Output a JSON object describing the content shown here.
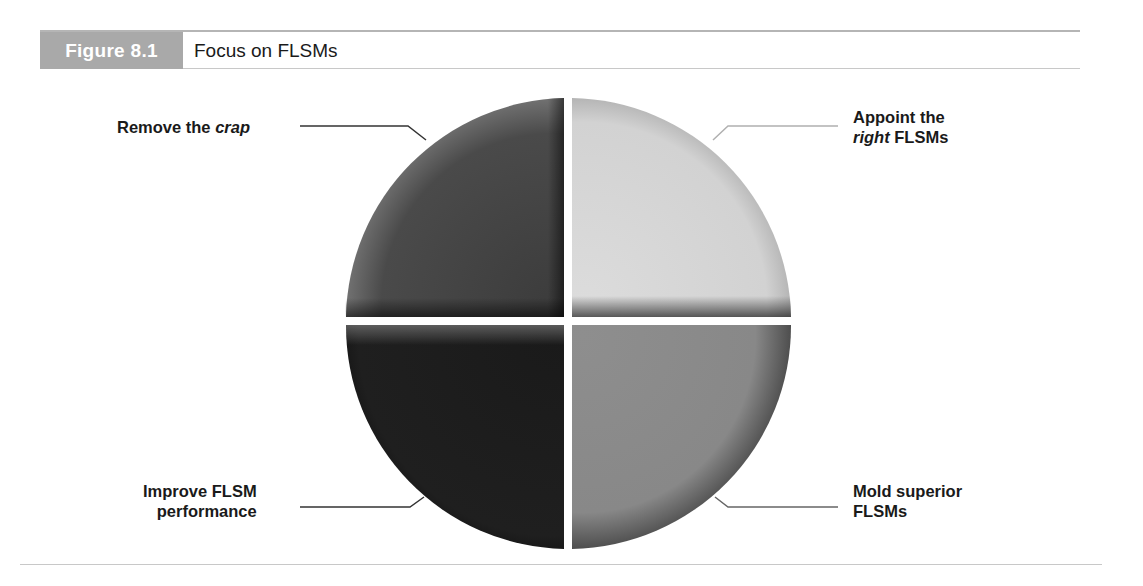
{
  "figure": {
    "number_label": "Figure 8.1",
    "title": "Focus on FLSMs"
  },
  "quadrants": [
    {
      "position": "top-left",
      "label_plain": "Remove the ",
      "label_italic": "crap",
      "label_after": "",
      "shade": "#4a4a4a"
    },
    {
      "position": "top-right",
      "label_line1": "Appoint the",
      "label_italic": "right",
      "label_after": " FLSMs",
      "shade": "#d6d6d6"
    },
    {
      "position": "bottom-left",
      "label_line1": "Improve FLSM",
      "label_line2": "performance",
      "shade": "#1c1c1c"
    },
    {
      "position": "bottom-right",
      "label_line1": "Mold superior",
      "label_line2": "FLSMs",
      "shade": "#8a8a8a"
    }
  ]
}
